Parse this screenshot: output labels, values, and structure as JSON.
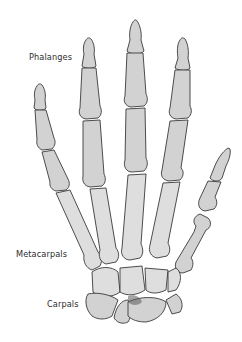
{
  "figure": {
    "labels": {
      "phalanges": "Phalanges",
      "metacarpals": "Metacarpals",
      "carpals": "Carpals"
    },
    "colors": {
      "bone_fill": "#d2d2d2",
      "outline": "#3a3a3a",
      "label_text": "#2e2e2e",
      "background": "#ffffff"
    },
    "icons": {
      "illustration": "hand-skeleton-illustration"
    }
  }
}
